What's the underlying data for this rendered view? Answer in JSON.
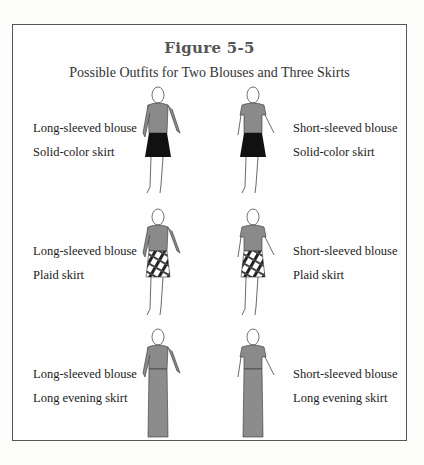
{
  "figure": {
    "title": "Figure 5-5",
    "subtitle": "Possible Outfits for Two Blouses and Three Skirts",
    "outfits": [
      {
        "blouse": "Long-sleeved blouse",
        "skirt": "Solid-color skirt",
        "sleeve": "long",
        "skirt_style": "solid"
      },
      {
        "blouse": "Short-sleeved blouse",
        "skirt": "Solid-color skirt",
        "sleeve": "short",
        "skirt_style": "solid"
      },
      {
        "blouse": "Long-sleeved blouse",
        "skirt": "Plaid skirt",
        "sleeve": "long",
        "skirt_style": "plaid"
      },
      {
        "blouse": "Short-sleeved blouse",
        "skirt": "Plaid skirt",
        "sleeve": "short",
        "skirt_style": "plaid"
      },
      {
        "blouse": "Long-sleeved blouse",
        "skirt": "Long evening skirt",
        "sleeve": "long",
        "skirt_style": "long"
      },
      {
        "blouse": "Short-sleeved blouse",
        "skirt": "Long evening skirt",
        "sleeve": "short",
        "skirt_style": "long"
      }
    ],
    "colors": {
      "blouse": "#8a8a8a",
      "solid_skirt": "#111111",
      "evening_skirt": "#8c8c8c",
      "frame": "#555555"
    }
  }
}
